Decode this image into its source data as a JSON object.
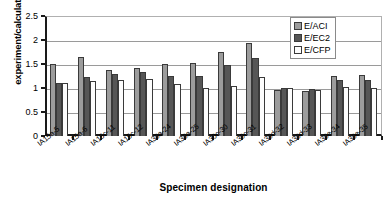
{
  "chart_data": {
    "type": "bar",
    "title": "",
    "xlabel": "Specimen designation",
    "ylabel": "experiment/calculation",
    "ylim": [
      0,
      2.5
    ],
    "yticks": [
      "0",
      "0.5",
      "1",
      "1.5",
      "2",
      "2.5"
    ],
    "ytick_values": [
      0,
      0.5,
      1,
      1.5,
      2,
      2.5
    ],
    "grid": true,
    "legend_position": "top-right",
    "categories": [
      "IA15a-5",
      "IA15a-6",
      "IA15c-11",
      "IA15c-12",
      "IA30a-24",
      "IA30a-25",
      "IA30c-30",
      "IA30c-31",
      "IA30d-32",
      "IA30d-33",
      "IA30e-34",
      "IA30e-35"
    ],
    "series": [
      {
        "name": "E/ACI",
        "color": "#9c9c9c",
        "values": [
          1.49,
          1.64,
          1.38,
          1.42,
          1.5,
          1.52,
          1.74,
          1.93,
          0.95,
          0.94,
          1.26,
          1.28
        ]
      },
      {
        "name": "E/EC2",
        "color": "#565656",
        "values": [
          1.11,
          1.22,
          1.3,
          1.33,
          1.26,
          1.24,
          1.47,
          1.63,
          1.0,
          0.98,
          1.17,
          1.17
        ]
      },
      {
        "name": "E/CFP",
        "color": "#fdfdfd",
        "values": [
          1.1,
          1.15,
          1.17,
          1.18,
          1.08,
          1.0,
          1.04,
          1.22,
          0.99,
          0.95,
          1.02,
          1.01
        ]
      }
    ]
  }
}
